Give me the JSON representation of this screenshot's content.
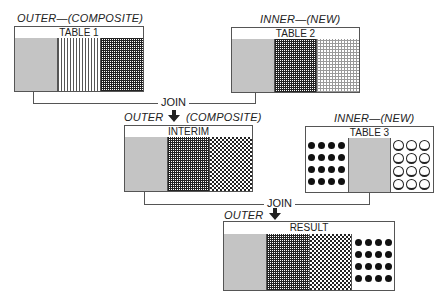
{
  "diagram": {
    "tables": [
      {
        "id": "table1",
        "caption": "OUTER—(COMPOSITE)",
        "name": "TABLE 1",
        "columns": [
          "gray",
          "vertical-lines",
          "dense-grid"
        ]
      },
      {
        "id": "table2",
        "caption": "INNER—(NEW)",
        "name": "TABLE 2",
        "columns": [
          "gray",
          "dense-grid",
          "light-grid"
        ]
      },
      {
        "id": "interim",
        "caption_left": "OUTER",
        "caption_right": "(COMPOSITE)",
        "name": "INTERIM",
        "columns": [
          "gray",
          "dense-grid",
          "checker"
        ]
      },
      {
        "id": "table3",
        "caption": "INNER—(NEW)",
        "name": "TABLE 3",
        "columns": [
          "solid-dots",
          "gray",
          "open-circles"
        ]
      },
      {
        "id": "result",
        "caption_left": "OUTER",
        "name": "RESULT",
        "columns": [
          "gray",
          "dense-grid",
          "checker",
          "solid-dots"
        ]
      }
    ],
    "joins": [
      {
        "label": "JOIN",
        "from": [
          "table1",
          "table2"
        ],
        "to": "interim"
      },
      {
        "label": "JOIN",
        "from": [
          "interim",
          "table3"
        ],
        "to": "result"
      }
    ]
  },
  "colors": {
    "line": "#555555",
    "gray_fill": "#c4c4c4",
    "ink": "#222222"
  }
}
